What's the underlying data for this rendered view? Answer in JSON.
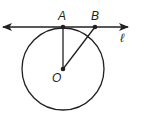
{
  "diagram": {
    "colors": {
      "stroke": "#231f20",
      "background": "#ffffff"
    },
    "circle": {
      "center_label": "O",
      "cx": 63,
      "cy": 69,
      "r": 41
    },
    "line": {
      "label": "ℓ",
      "x1": 2,
      "y1": 27,
      "x2": 128,
      "y2": 27,
      "arrows": "both"
    },
    "points": [
      {
        "label": "A",
        "x": 63,
        "y": 27
      },
      {
        "label": "B",
        "x": 95,
        "y": 27
      },
      {
        "label": "O",
        "x": 63,
        "y": 69
      }
    ],
    "segments": [
      {
        "from": "O",
        "to": "A"
      },
      {
        "from": "O",
        "to": "B"
      }
    ],
    "labels": {
      "A": "A",
      "B": "B",
      "O": "O",
      "l": "ℓ"
    }
  }
}
